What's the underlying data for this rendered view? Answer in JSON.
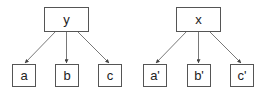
{
  "trees": [
    {
      "root": {
        "label": "y"
      },
      "children": [
        {
          "label": "a"
        },
        {
          "label": "b"
        },
        {
          "label": "c"
        }
      ]
    },
    {
      "root": {
        "label": "x"
      },
      "children": [
        {
          "label": "a'"
        },
        {
          "label": "b'"
        },
        {
          "label": "c'"
        }
      ]
    }
  ]
}
